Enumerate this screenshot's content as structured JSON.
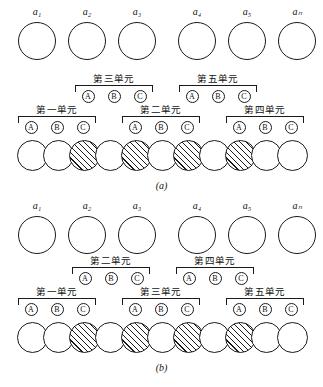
{
  "figure": {
    "atom_labels": [
      "a₁",
      "a₂",
      "a₃",
      "a₄",
      "a₅",
      "aₙ"
    ],
    "unit_letters": [
      "A",
      "B",
      "C"
    ],
    "panels": [
      {
        "id": "a",
        "caption": "(a)",
        "atoms": [
          {
            "label": "a₁"
          },
          {
            "label": "a₂"
          },
          {
            "label": "a₃"
          },
          {
            "label": "a₄"
          },
          {
            "label": "a₅"
          },
          {
            "label": "aₙ"
          }
        ],
        "upper_units": [
          {
            "title": "第三单元",
            "letters": [
              "A",
              "B",
              "C"
            ]
          },
          {
            "title": "第五单元",
            "letters": [
              "A",
              "B",
              "C"
            ]
          }
        ],
        "lower_units": [
          {
            "title": "第一单元",
            "letters": [
              "A",
              "B",
              "C"
            ]
          },
          {
            "title": "第二单元",
            "letters": [
              "A",
              "B",
              "C"
            ]
          },
          {
            "title": "第四单元",
            "letters": [
              "A",
              "B",
              "C"
            ]
          }
        ],
        "chain": [
          "white",
          "white",
          "hatched",
          "white",
          "hatched",
          "white",
          "hatched",
          "white",
          "hatched",
          "white",
          "white"
        ]
      },
      {
        "id": "b",
        "caption": "(b)",
        "atoms": [
          {
            "label": "a₁"
          },
          {
            "label": "a₂"
          },
          {
            "label": "a₃"
          },
          {
            "label": "a₄"
          },
          {
            "label": "a₅"
          },
          {
            "label": "aₙ"
          }
        ],
        "upper_units": [
          {
            "title": "第二单元",
            "letters": [
              "A",
              "B",
              "C"
            ]
          },
          {
            "title": "第四单元",
            "letters": [
              "A",
              "B",
              "C"
            ]
          }
        ],
        "lower_units": [
          {
            "title": "第一单元",
            "letters": [
              "A",
              "B",
              "C"
            ]
          },
          {
            "title": "第三单元",
            "letters": [
              "A",
              "B",
              "C"
            ]
          },
          {
            "title": "第五单元",
            "letters": [
              "A",
              "B",
              "C"
            ]
          }
        ],
        "chain": [
          "white",
          "white",
          "hatched",
          "white",
          "hatched",
          "white",
          "hatched",
          "white",
          "hatched",
          "white",
          "white"
        ]
      }
    ],
    "colors": {
      "stroke": "#1a1a1a",
      "background": "#ffffff",
      "hatch": "#1a1a1a"
    }
  }
}
